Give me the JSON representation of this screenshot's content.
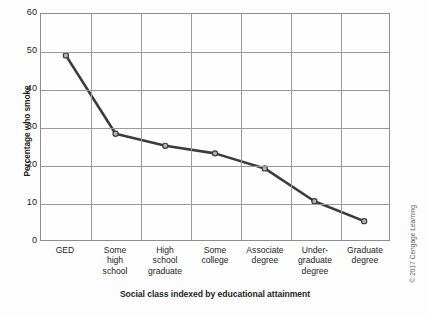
{
  "chart_data": {
    "type": "line",
    "title": "",
    "xlabel": "Social class indexed by educational attainment",
    "ylabel": "Percentage who smoke",
    "categories": [
      "GED",
      "Some high school",
      "High school graduate",
      "Some college",
      "Associate degree",
      "Under-graduate degree",
      "Graduate degree"
    ],
    "category_lines": [
      [
        "GED"
      ],
      [
        "Some",
        "high",
        "school"
      ],
      [
        "High",
        "school",
        "graduate"
      ],
      [
        "Some",
        "college"
      ],
      [
        "Associate",
        "degree"
      ],
      [
        "Under-",
        "graduate",
        "degree"
      ],
      [
        "Graduate",
        "degree"
      ]
    ],
    "values": [
      49,
      28.2,
      25,
      23,
      19,
      10.3,
      5
    ],
    "ylim": [
      0,
      60
    ],
    "yticks": [
      0,
      10,
      20,
      30,
      40,
      50,
      60
    ],
    "ytick_labels": [
      "0",
      "10",
      "20",
      "30",
      "40",
      "50",
      "60"
    ],
    "grid": true,
    "legend": "none",
    "series_color": "#3b3b3b",
    "grid_color": "#9a9a9a",
    "marker": "open-circle",
    "marker_fill": "#b3b3b3"
  },
  "credit": {
    "text": "© 2017 Cengage Learning"
  }
}
